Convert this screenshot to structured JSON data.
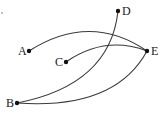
{
  "diagram": {
    "type": "graph",
    "nodes": [
      {
        "id": "A",
        "label": "A",
        "x": 29,
        "y": 51,
        "label_x": 18,
        "label_y": 55
      },
      {
        "id": "B",
        "label": "B",
        "x": 17,
        "y": 103,
        "label_x": 6,
        "label_y": 107
      },
      {
        "id": "C",
        "label": "C",
        "x": 66,
        "y": 62,
        "label_x": 55,
        "label_y": 66
      },
      {
        "id": "D",
        "label": "D",
        "x": 118,
        "y": 11,
        "label_x": 122,
        "label_y": 15
      },
      {
        "id": "E",
        "label": "E",
        "x": 147,
        "y": 51,
        "label_x": 151,
        "label_y": 55
      }
    ],
    "edges": [
      {
        "from": "A",
        "to": "E",
        "path": "M29,51 Q90,12 147,51"
      },
      {
        "from": "C",
        "to": "E",
        "path": "M66,62 Q105,35 147,51"
      },
      {
        "from": "B",
        "to": "D",
        "path": "M17,103 Q110,85 118,11"
      },
      {
        "from": "B",
        "to": "E",
        "path": "M17,103 Q115,110 147,51"
      }
    ],
    "colors": {
      "edge": "#3a3a3a",
      "node": "#111111",
      "label": "#222222"
    }
  }
}
